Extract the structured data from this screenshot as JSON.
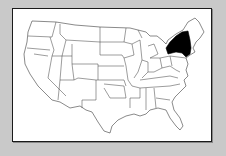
{
  "map": {
    "title": "United States map",
    "highlighted_state": "New York",
    "highlight_color": "#000000",
    "base_fill": "#ffffff",
    "border_color": "#3a3a3a",
    "background_color": "#c9c9c9"
  }
}
